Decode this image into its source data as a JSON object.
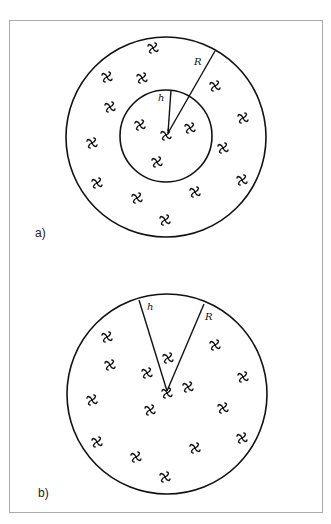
{
  "figure": {
    "stroke_color": "#111111",
    "frame_color": "#aaaaaa",
    "galaxy_glyph": "࿕",
    "panels": [
      {
        "id": "a",
        "label": "a)",
        "label_pos": [
          35,
          226
        ],
        "outer_circle": {
          "cx": 166,
          "cy": 137,
          "r": 100
        },
        "inner_circle": {
          "cx": 166,
          "cy": 136,
          "r": 46
        },
        "center": [
          168,
          133
        ],
        "radius_lines": [
          {
            "name": "R",
            "label": "R",
            "end": [
              215,
              51
            ],
            "label_pos": [
              194,
              65
            ]
          },
          {
            "name": "h",
            "label": "h",
            "end": [
              171,
              90
            ],
            "label_pos": [
              158,
              101
            ]
          }
        ],
        "galaxies": [
          [
            153,
            48
          ],
          [
            107,
            77
          ],
          [
            142,
            78
          ],
          [
            215,
            86
          ],
          [
            110,
            107
          ],
          [
            243,
            118
          ],
          [
            140,
            125
          ],
          [
            190,
            128
          ],
          [
            166,
            135
          ],
          [
            92,
            143
          ],
          [
            223,
            148
          ],
          [
            157,
            162
          ],
          [
            242,
            180
          ],
          [
            97,
            183
          ],
          [
            195,
            192
          ],
          [
            137,
            198
          ],
          [
            165,
            220
          ]
        ]
      },
      {
        "id": "b",
        "label": "b)",
        "label_pos": [
          38,
          486
        ],
        "outer_circle": {
          "cx": 167,
          "cy": 394,
          "r": 100
        },
        "center": [
          167,
          391
        ],
        "radius_lines": [
          {
            "name": "h",
            "label": "h",
            "end": [
              139,
              300
            ],
            "label_pos": [
              147,
              310
            ]
          },
          {
            "name": "R",
            "label": "R",
            "end": [
              204,
              304
            ],
            "label_pos": [
              205,
              320
            ]
          }
        ],
        "galaxies": [
          [
            107,
            337
          ],
          [
            215,
            345
          ],
          [
            168,
            358
          ],
          [
            110,
            365
          ],
          [
            147,
            373
          ],
          [
            243,
            377
          ],
          [
            188,
            387
          ],
          [
            167,
            393
          ],
          [
            92,
            400
          ],
          [
            150,
            410
          ],
          [
            223,
            408
          ],
          [
            242,
            438
          ],
          [
            97,
            442
          ],
          [
            195,
            448
          ],
          [
            136,
            457
          ],
          [
            165,
            477
          ]
        ]
      }
    ]
  }
}
